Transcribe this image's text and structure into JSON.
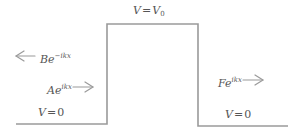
{
  "diagram": {
    "type": "potential-barrier",
    "colors": {
      "line": "#9a9a9a",
      "text": "#555555",
      "arrow": "#9a9a9a",
      "background": "#ffffff"
    },
    "regions": {
      "left": {
        "potential_label": {
          "var": "V",
          "eq": "=",
          "value": "0"
        }
      },
      "barrier": {
        "potential_label": {
          "var": "V",
          "eq": "=",
          "value": "V",
          "sub": "0"
        }
      },
      "right": {
        "potential_label": {
          "var": "V",
          "eq": "=",
          "value": "0"
        }
      }
    },
    "waves": {
      "reflected": {
        "coef": "B",
        "base": "e",
        "exponent": "−ikx",
        "direction": "left"
      },
      "incident": {
        "coef": "A",
        "base": "e",
        "exponent": "ikx",
        "direction": "right"
      },
      "transmitted": {
        "coef": "F",
        "base": "e",
        "exponent": "ikx",
        "direction": "right"
      }
    }
  }
}
